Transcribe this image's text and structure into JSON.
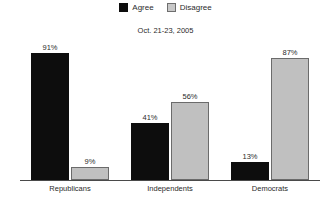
{
  "legend": {
    "position": "top-center",
    "entries": [
      {
        "label": "Agree",
        "swatch": "agree-swatch",
        "color": "#0d0d0d"
      },
      {
        "label": "Disagree",
        "swatch": "disagree-swatch",
        "color": "#c0c0c0"
      }
    ]
  },
  "subtitle": "Oct. 21-23, 2005",
  "chart_data": {
    "type": "bar",
    "title": "",
    "subtitle": "Oct. 21-23, 2005",
    "xlabel": "",
    "ylabel": "",
    "ylim": [
      0,
      100
    ],
    "grid": false,
    "legend_position": "top-center",
    "categories": [
      "Republicans",
      "Independents",
      "Democrats"
    ],
    "series": [
      {
        "name": "Agree",
        "color": "#0d0d0d",
        "values": [
          91,
          41,
          13
        ],
        "labels": [
          "91%",
          "41%",
          "13%"
        ]
      },
      {
        "name": "Disagree",
        "color": "#c0c0c0",
        "values": [
          9,
          56,
          87
        ],
        "labels": [
          "9%",
          "56%",
          "87%"
        ]
      }
    ]
  }
}
